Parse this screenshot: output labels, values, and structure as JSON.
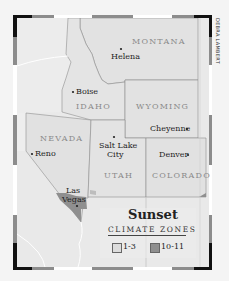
{
  "credit": "DEBRA LAMBERT",
  "states": [
    {
      "name": "MONTANA",
      "x": 132,
      "y": 39
    },
    {
      "name": "IDAHO",
      "x": 76,
      "y": 104
    },
    {
      "name": "WYOMING",
      "x": 136,
      "y": 104
    },
    {
      "name": "NEVADA",
      "x": 40,
      "y": 136
    },
    {
      "name": "UTAH",
      "x": 104,
      "y": 172
    },
    {
      "name": "COLORADO",
      "x": 152,
      "y": 172
    }
  ],
  "cities": [
    {
      "name": "Helena",
      "x": 111,
      "y": 52,
      "dot": "above"
    },
    {
      "name": "Boise",
      "x": 71,
      "y": 87,
      "dot": "left"
    },
    {
      "name": "Cheyenne",
      "x": 150,
      "y": 124,
      "dot": "right"
    },
    {
      "name": "Reno",
      "x": 30,
      "y": 150,
      "dot": "left"
    },
    {
      "name": "Salt Lake",
      "x": 99,
      "y": 143,
      "dot": "above"
    },
    {
      "name": "City",
      "x": 107,
      "y": 152,
      "dot": "none"
    },
    {
      "name": "Denver",
      "x": 159,
      "y": 150,
      "dot": "right"
    },
    {
      "name": "Las",
      "x": 66,
      "y": 186,
      "dot": "none"
    },
    {
      "name": "Vegas",
      "x": 62,
      "y": 195,
      "dot": "below"
    }
  ],
  "legend": {
    "title": "Sunset",
    "subtitle": "CLIMATE ZONES",
    "items": [
      {
        "label": "1-3",
        "color": "#dcdcdc"
      },
      {
        "label": "10-11",
        "color": "#8f8f8f"
      }
    ]
  },
  "colors": {
    "land": "#e6e6e6",
    "zone_1_3": "#dcdcdc",
    "zone_10_11": "#8f8f8f",
    "border": "#8a8a8a",
    "frame_black": "#111111",
    "frame_gray": "#8c8c8c",
    "frame_white": "#ffffff"
  }
}
